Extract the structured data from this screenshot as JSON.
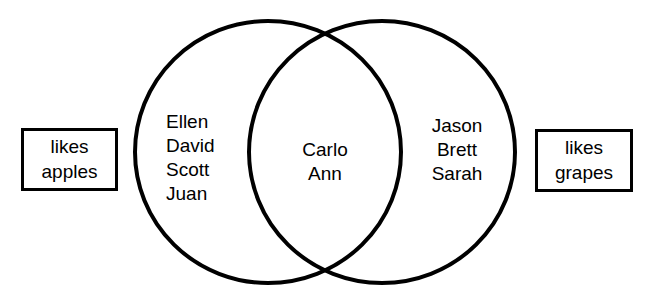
{
  "diagram": {
    "type": "venn-2set",
    "background_color": "#ffffff",
    "stroke_color": "#000000",
    "left_label": {
      "lines": [
        "likes",
        "apples"
      ]
    },
    "right_label": {
      "lines": [
        "likes",
        "grapes"
      ]
    },
    "sets": {
      "left_only": {
        "region": "likes apples only",
        "names": [
          "Ellen",
          "David",
          "Scott",
          "Juan"
        ]
      },
      "intersection": {
        "region": "likes apples and grapes",
        "names": [
          "Carlo",
          "Ann"
        ]
      },
      "right_only": {
        "region": "likes grapes only",
        "names": [
          "Jason",
          "Brett",
          "Sarah"
        ]
      }
    }
  }
}
